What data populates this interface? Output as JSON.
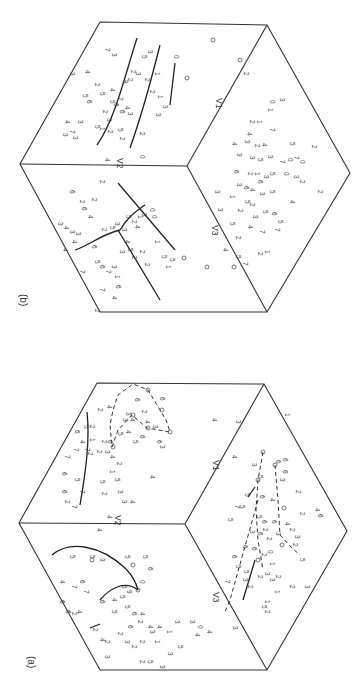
{
  "figure": {
    "orientation": "rotated 90 degrees clockwise",
    "panels": [
      {
        "id": "a",
        "label": "(a)",
        "axes": {
          "v1": "V1",
          "v2": "V2",
          "v3": "V3"
        },
        "edge_ticks": [
          "4",
          "4",
          "3",
          "3",
          "3",
          "1",
          "6"
        ],
        "face_v2": {
          "points": [
            "2",
            "4",
            "6",
            "2",
            "6",
            "5",
            "4",
            "1",
            "6",
            "2",
            "5",
            "7",
            "2",
            "2",
            "6",
            "2",
            "6",
            "7",
            "3",
            "4",
            "5",
            "7",
            "6",
            "4",
            "3",
            "4",
            "2",
            "1",
            "2",
            "5",
            "2",
            "5",
            "3",
            "1",
            "3",
            "4",
            "6",
            "3",
            "5",
            "4",
            "5",
            "6",
            "4",
            "4",
            "6",
            "1",
            "2",
            "2",
            "3",
            "3",
            "4",
            "0",
            "0",
            "0",
            "0",
            "0",
            "0",
            "0"
          ],
          "has_curve": true,
          "has_dashed_polygon": true
        },
        "face_v3": {
          "points": [
            "7",
            "0",
            "5",
            "3",
            "5",
            "0",
            "0",
            "6",
            "4",
            "4",
            "7",
            "6",
            "5",
            "3",
            "6",
            "6",
            "2",
            "4",
            "6",
            "5",
            "4",
            "5",
            "2",
            "1",
            "7",
            "2",
            "6",
            "3",
            "0",
            "2",
            "2",
            "4",
            "4",
            "2",
            "2",
            "1",
            "3",
            "3",
            "4",
            "0",
            "3",
            "2",
            "5",
            "2",
            "5",
            "3",
            "1",
            "4",
            "3",
            "6",
            "0",
            "0",
            "0",
            "0"
          ],
          "has_curve": true
        },
        "face_v1": {
          "points": [
            "1",
            "0",
            "0",
            "6",
            "6",
            "5",
            "2",
            "3",
            "5",
            "4",
            "6",
            "7",
            "5",
            "6",
            "1",
            "4",
            "2",
            "3",
            "4",
            "5",
            "6",
            "7",
            "4",
            "6",
            "2",
            "3",
            "2",
            "5",
            "2",
            "3",
            "1",
            "2",
            "2",
            "3",
            "4",
            "2",
            "2",
            "3",
            "2",
            "1",
            "2",
            "5",
            "2",
            "3",
            "4",
            "4",
            "5",
            "0",
            "0",
            "0"
          ],
          "has_dashed_lines": true,
          "has_solid_segment": true
        }
      },
      {
        "id": "b",
        "label": "(b)",
        "axes": {
          "v1": "V1",
          "v2": "V2",
          "v3": "V3"
        },
        "edge_ticks": [
          "6",
          "2",
          "2",
          "2",
          "4",
          "6",
          "2"
        ],
        "face_v2": {
          "points": [
            "7",
            "3",
            "4",
            "3",
            "2",
            "5",
            "4",
            "4",
            "6",
            "2",
            "5",
            "3",
            "5",
            "6",
            "5",
            "7",
            "3",
            "6",
            "6",
            "4",
            "6",
            "2",
            "5",
            "3",
            "3",
            "2",
            "3",
            "3",
            "2",
            "1",
            "4",
            "7",
            "3",
            "4",
            "3",
            "6",
            "5",
            "3",
            "5",
            "2",
            "2",
            "5",
            "0",
            "3",
            "1",
            "1",
            "1",
            "0",
            "2",
            "4",
            "5",
            "3"
          ],
          "has_curves": 3
        },
        "face_v3": {
          "points": [
            "6",
            "2",
            "6",
            "2",
            "4",
            "3",
            "3",
            "4",
            "3",
            "3",
            "3",
            "4",
            "3",
            "4",
            "3",
            "5",
            "2",
            "4",
            "5",
            "6",
            "3",
            "5",
            "5",
            "4",
            "7",
            "6",
            "3",
            "3",
            "1",
            "3",
            "2",
            "2",
            "7",
            "6",
            "2",
            "4",
            "7",
            "3",
            "1",
            "1",
            "0",
            "0",
            "5",
            "1",
            "5",
            "2",
            "2",
            "7",
            "4",
            "6"
          ],
          "has_curve": true,
          "has_straight_lines": 2
        },
        "face_v1": {
          "points": [
            "2",
            "3",
            "0",
            "1",
            "1",
            "2",
            "4",
            "4",
            "1",
            "7",
            "3",
            "3",
            "2",
            "4",
            "5",
            "5",
            "3",
            "5",
            "0",
            "2",
            "3",
            "6",
            "4",
            "3",
            "2",
            "6",
            "3",
            "5",
            "0",
            "2",
            "3",
            "5",
            "2",
            "5",
            "5",
            "2",
            "4",
            "2",
            "3",
            "3",
            "4",
            "7",
            "2",
            "7",
            "2",
            "5",
            "7",
            "0",
            "0",
            "0",
            "0"
          ],
          "has_scatter_only": true
        }
      }
    ]
  }
}
